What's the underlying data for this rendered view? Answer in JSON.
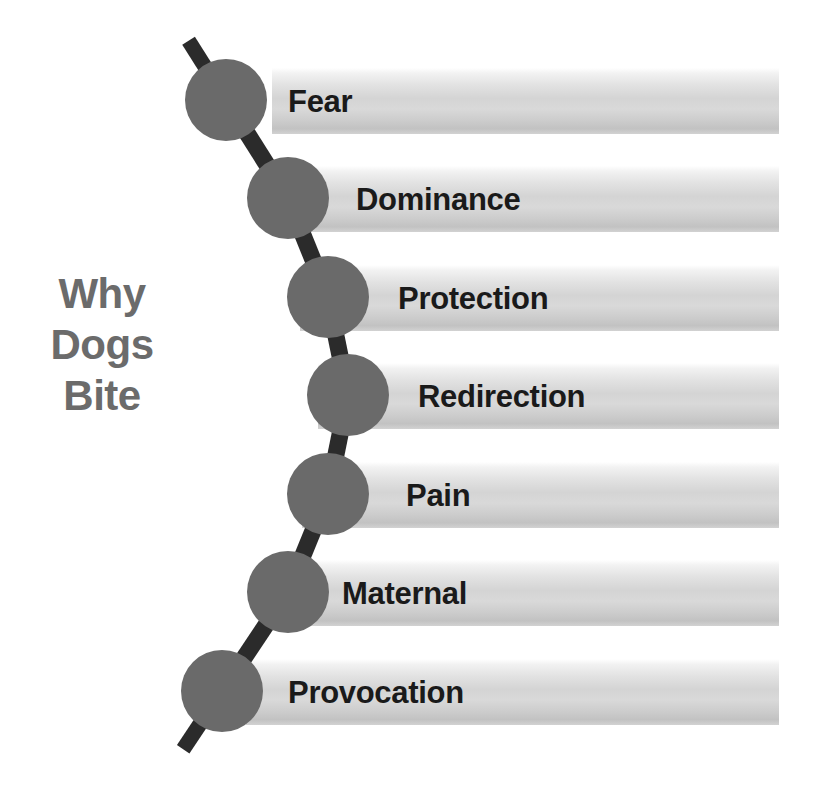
{
  "title": {
    "lines": [
      "Why",
      "Dogs",
      "Bite"
    ],
    "color": "#6b6b6b"
  },
  "palette": {
    "node_fill": "#6a6a6a",
    "connector": "#2b2b2b",
    "bar_light": "#f2f2f2",
    "bar_mid": "#d4d4d4",
    "bar_dark": "#c2c2c2",
    "label_text": "#1a1a1a",
    "background": "#ffffff"
  },
  "chart_data": {
    "type": "diagram",
    "subtype": "linked-node-bar-list",
    "categories": [
      "Fear",
      "Dominance",
      "Protection",
      "Redirection",
      "Pain",
      "Maternal",
      "Provocation"
    ],
    "legend": [],
    "xlabel": "",
    "ylabel": "",
    "note": "Seven reasons listed vertically; a zig-zag chain of circular nodes links each row."
  },
  "items": [
    {
      "label": "Fear",
      "bar_left": 272,
      "bar_top": 68,
      "bar_width": 507,
      "label_left": 288,
      "label_top": 84,
      "node_cx": 226,
      "node_cy": 100,
      "node_r": 41
    },
    {
      "label": "Dominance",
      "bar_left": 278,
      "bar_top": 166,
      "bar_width": 501,
      "label_left": 356,
      "label_top": 182,
      "node_cx": 288,
      "node_cy": 198,
      "node_r": 41
    },
    {
      "label": "Protection",
      "bar_left": 300,
      "bar_top": 265,
      "bar_width": 479,
      "label_left": 398,
      "label_top": 281,
      "node_cx": 328,
      "node_cy": 297,
      "node_r": 41
    },
    {
      "label": "Redirection",
      "bar_left": 318,
      "bar_top": 363,
      "bar_width": 461,
      "label_left": 418,
      "label_top": 379,
      "node_cx": 348,
      "node_cy": 395,
      "node_r": 41
    },
    {
      "label": "Pain",
      "bar_left": 302,
      "bar_top": 462,
      "bar_width": 477,
      "label_left": 406,
      "label_top": 478,
      "node_cx": 328,
      "node_cy": 494,
      "node_r": 41
    },
    {
      "label": "Maternal",
      "bar_left": 276,
      "bar_top": 560,
      "bar_width": 503,
      "label_left": 342,
      "label_top": 576,
      "node_cx": 288,
      "node_cy": 592,
      "node_r": 41
    },
    {
      "label": "Provocation",
      "bar_left": 246,
      "bar_top": 659,
      "bar_width": 533,
      "label_left": 288,
      "label_top": 675,
      "node_cx": 222,
      "node_cy": 691,
      "node_r": 41
    }
  ]
}
